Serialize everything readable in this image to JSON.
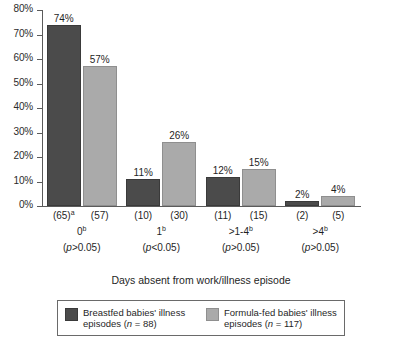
{
  "chart_data": {
    "type": "bar",
    "title": "",
    "xlabel": "Days absent from work/illness episode",
    "ylabel": "",
    "ylim": [
      0,
      80
    ],
    "ytick_labels": [
      "0%",
      "10%",
      "20%",
      "30%",
      "40%",
      "50%",
      "60%",
      "70%",
      "80%"
    ],
    "ytick_values": [
      0,
      10,
      20,
      30,
      40,
      50,
      60,
      70,
      80
    ],
    "grid": false,
    "legend_position": "bottom",
    "categories": [
      "0",
      "1",
      ">1-4",
      ">4"
    ],
    "category_superscripts": [
      "b",
      "b",
      "b",
      "b"
    ],
    "category_pvalues": [
      "(p>0.05)",
      "(p<0.05)",
      "(p>0.05)",
      "(p>0.05)"
    ],
    "series": [
      {
        "name": "Breastfed babies' illness episodes (n = 88)",
        "color": "#4b4b4b",
        "values": [
          74,
          11,
          12,
          2
        ],
        "value_labels": [
          "74%",
          "11%",
          "12%",
          "2%"
        ],
        "counts": [
          "(65)",
          "(10)",
          "(11)",
          "(2)"
        ],
        "count_superscripts": [
          "a",
          "",
          "",
          ""
        ]
      },
      {
        "name": "Formula-fed babies' illness episodes (n = 117)",
        "color": "#aaaaaa",
        "values": [
          57,
          26,
          15,
          4
        ],
        "value_labels": [
          "57%",
          "26%",
          "15%",
          "4%"
        ],
        "counts": [
          "(57)",
          "(30)",
          "(15)",
          "(5)"
        ],
        "count_superscripts": [
          "",
          "",
          "",
          ""
        ]
      }
    ]
  },
  "legend": {
    "entries": [
      {
        "line1": "Breastfed babies' illness",
        "line2_pre": "episodes (",
        "line2_italic": "n",
        "line2_post": " = 88)"
      },
      {
        "line1": "Formula-fed babies' illness",
        "line2_pre": "episodes (",
        "line2_italic": "n",
        "line2_post": " = 117)"
      }
    ]
  },
  "colors": {
    "series_a": "#4b4b4b",
    "series_b": "#aaaaaa",
    "axis": "#5b5b5b",
    "text": "#1f1f1f",
    "background": "#ffffff"
  }
}
